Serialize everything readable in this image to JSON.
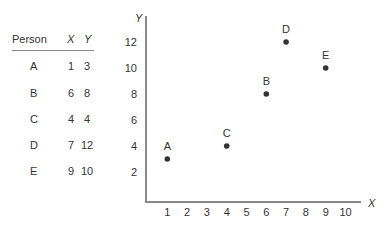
{
  "table": {
    "headers": [
      "Person",
      "X",
      "Y"
    ],
    "rows": [
      {
        "person": "A",
        "x": "1",
        "y": "3"
      },
      {
        "person": "B",
        "x": "6",
        "y": "8"
      },
      {
        "person": "C",
        "x": "4",
        "y": "4"
      },
      {
        "person": "D",
        "x": "7",
        "y": "12"
      },
      {
        "person": "E",
        "x": "9",
        "y": "10"
      }
    ]
  },
  "chart_data": {
    "type": "scatter",
    "title": "",
    "xlabel": "X",
    "ylabel": "Y",
    "xlim": [
      0,
      10.5
    ],
    "ylim": [
      0,
      13
    ],
    "x_ticks": [
      "1",
      "2",
      "3",
      "4",
      "5",
      "6",
      "7",
      "8",
      "9",
      "10"
    ],
    "y_ticks": [
      "2",
      "4",
      "6",
      "8",
      "10",
      "12"
    ],
    "grid": false,
    "legend": null,
    "points": [
      {
        "label": "A",
        "x": 1,
        "y": 3
      },
      {
        "label": "B",
        "x": 6,
        "y": 8
      },
      {
        "label": "C",
        "x": 4,
        "y": 4
      },
      {
        "label": "D",
        "x": 7,
        "y": 12
      },
      {
        "label": "E",
        "x": 9,
        "y": 10
      }
    ],
    "colors": {
      "axis": "#888888",
      "point": "#333333",
      "text": "#333333"
    }
  }
}
